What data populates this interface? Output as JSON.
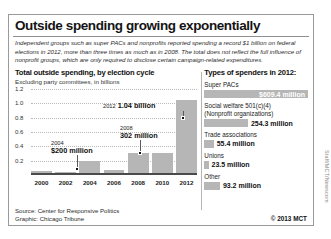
{
  "headline": "Outside spending growing exponentially",
  "deck": "Independent groups such as super PACs and nonprofits reported spending a record $1 billion on federal elections in 2012, more than three times as much as in 2008. The total does not reflect the full influence of nonprofit groups, which are only required to disclose certain campaign-related expenditures.",
  "chart_data": {
    "type": "bar",
    "title": "Total outside spending, by election cycle",
    "subtitle": "Excluding party committees, in billions",
    "xlabel": "",
    "ylabel": "",
    "categories": [
      "2000",
      "2002",
      "2004",
      "2006",
      "2008",
      "2010",
      "2012"
    ],
    "values": [
      0.05,
      0.04,
      0.2,
      0.07,
      0.302,
      0.305,
      1.04
    ],
    "ylim": [
      0,
      1.2
    ],
    "yticks": [
      "1.2",
      "1.0",
      "0.8",
      "0.6",
      "0.4",
      "0.2"
    ],
    "ytick_values": [
      1.2,
      1.0,
      0.8,
      0.6,
      0.4,
      0.2
    ],
    "grid": true,
    "legend": "none",
    "annotations": [
      {
        "year": "2004",
        "value": "$200 million",
        "category": "2004"
      },
      {
        "year": "2008",
        "value": "302 million",
        "category": "2008"
      },
      {
        "year": "2012",
        "value": "1.04 billion",
        "category": "2012"
      }
    ]
  },
  "spenders": {
    "title": "Types of spenders in 2012:",
    "items": [
      {
        "label": "Super PACs",
        "label2": "",
        "value": "$609.4 million",
        "value_inside": true,
        "bar_pct": 100
      },
      {
        "label": "Social welfare 501(c)(4)",
        "label2": "(Nonprofit organizations)",
        "value": "254.3 million",
        "value_inside": false,
        "bar_pct": 42
      },
      {
        "label": "Trade associations",
        "label2": "",
        "value": "55.4 million",
        "value_inside": false,
        "bar_pct": 9
      },
      {
        "label": "Unions",
        "label2": "",
        "value": "23.5 million",
        "value_inside": false,
        "bar_pct": 4
      },
      {
        "label": "Other",
        "label2": "",
        "value": "93.2 million",
        "value_inside": false,
        "bar_pct": 15
      }
    ]
  },
  "footer": {
    "source": "Source: Center for Responsive Politics",
    "graphic": "Graphic: Chicago Tribune",
    "credit": "© 2013 MCT"
  },
  "side_credit": "Staff/MCT/Newscom"
}
